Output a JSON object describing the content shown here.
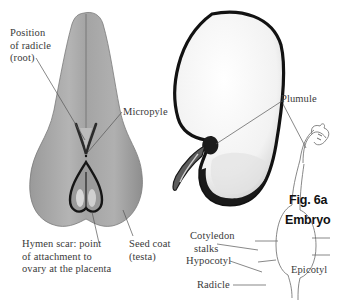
{
  "figure": {
    "number": "Fig. 6a",
    "title": "Embryo"
  },
  "seed_view": {
    "labels": {
      "radicle_line1": "Position",
      "radicle_line2": "of radicle",
      "radicle_line3": "(root)",
      "micropyle": "Micropyle",
      "hymen_line1": "Hymen scar: point",
      "hymen_line2": "of attachment to",
      "hymen_line3": "ovary at the placenta",
      "seedcoat_line1": "Seed coat",
      "seedcoat_line2": "(testa)"
    }
  },
  "section_view": {
    "labels": {
      "plumule": "Plumule"
    }
  },
  "embryo_view": {
    "labels": {
      "cotyledon_line1": "Cotyledon",
      "cotyledon_line2": "stalks",
      "hypocotyl": "Hypocotyl",
      "epicotyl": "Epicotyl",
      "radicle": "Radicle"
    }
  },
  "colors": {
    "seed_fill": "#a9a9a9",
    "seed_fill_dark": "#8c8c8c",
    "outline_dark": "#1a1a1a",
    "leader_line": "#555555",
    "label_text": "#3a3a3a",
    "figure_text": "#111111"
  }
}
